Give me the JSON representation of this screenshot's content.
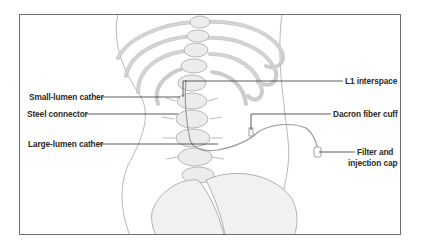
{
  "figure": {
    "type": "anatomical illustration",
    "colors": {
      "frame": "#6e6e6e",
      "leader_lines": "#333333",
      "illustration_stroke": "#b8b8b8",
      "illustration_fill": "#ececec",
      "label_text": "#2a2a2a"
    }
  },
  "labels": {
    "small_lumen": "Small-lumen cather",
    "steel_connector": "Steel connector",
    "large_lumen": "Large-lumen cather",
    "l1_interspace": "L1 interspace",
    "dacron_cuff": "Dacron fiber cuff",
    "filter_line1": "Filter and",
    "filter_line2": "injection cap"
  }
}
